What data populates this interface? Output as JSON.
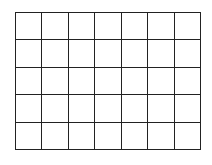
{
  "grid": {
    "rows": 5,
    "columns": 7,
    "line_color": "#222222",
    "background": "#ffffff",
    "cells": [
      [
        "",
        "",
        "",
        "",
        "",
        "",
        ""
      ],
      [
        "",
        "",
        "",
        "",
        "",
        "",
        ""
      ],
      [
        "",
        "",
        "",
        "",
        "",
        "",
        ""
      ],
      [
        "",
        "",
        "",
        "",
        "",
        "",
        ""
      ],
      [
        "",
        "",
        "",
        "",
        "",
        "",
        ""
      ]
    ]
  }
}
